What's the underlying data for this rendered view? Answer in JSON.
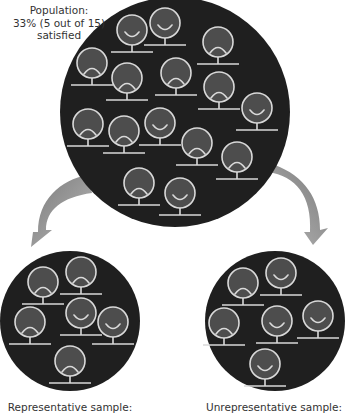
{
  "population": {
    "label_line1": "Population:",
    "label_line2": "33% (5 out of 15)",
    "label_line3": "satisfied",
    "total": 15,
    "satisfied": 5,
    "faces": [
      {
        "x": 132,
        "y": 30,
        "mood": "smile"
      },
      {
        "x": 165,
        "y": 23,
        "mood": "smile"
      },
      {
        "x": 218,
        "y": 42,
        "mood": "frown"
      },
      {
        "x": 92,
        "y": 63,
        "mood": "frown"
      },
      {
        "x": 127,
        "y": 78,
        "mood": "frown"
      },
      {
        "x": 176,
        "y": 73,
        "mood": "frown"
      },
      {
        "x": 219,
        "y": 87,
        "mood": "frown"
      },
      {
        "x": 257,
        "y": 108,
        "mood": "smile"
      },
      {
        "x": 88,
        "y": 124,
        "mood": "frown"
      },
      {
        "x": 124,
        "y": 131,
        "mood": "frown"
      },
      {
        "x": 160,
        "y": 123,
        "mood": "smile"
      },
      {
        "x": 197,
        "y": 143,
        "mood": "frown"
      },
      {
        "x": 237,
        "y": 157,
        "mood": "frown"
      },
      {
        "x": 139,
        "y": 183,
        "mood": "frown"
      },
      {
        "x": 180,
        "y": 193,
        "mood": "smile"
      }
    ]
  },
  "representative_sample": {
    "label": "Representative sample:",
    "faces": [
      {
        "x": 43,
        "y": 282,
        "mood": "frown"
      },
      {
        "x": 81,
        "y": 272,
        "mood": "frown"
      },
      {
        "x": 30,
        "y": 322,
        "mood": "frown"
      },
      {
        "x": 81,
        "y": 313,
        "mood": "smile"
      },
      {
        "x": 113,
        "y": 322,
        "mood": "smile"
      },
      {
        "x": 70,
        "y": 361,
        "mood": "frown"
      }
    ]
  },
  "unrepresentative_sample": {
    "label": "Unrepresentative sample:",
    "faces": [
      {
        "x": 243,
        "y": 283,
        "mood": "frown"
      },
      {
        "x": 281,
        "y": 273,
        "mood": "smile"
      },
      {
        "x": 224,
        "y": 323,
        "mood": "frown"
      },
      {
        "x": 277,
        "y": 321,
        "mood": "smile"
      },
      {
        "x": 318,
        "y": 316,
        "mood": "smile"
      },
      {
        "x": 265,
        "y": 364,
        "mood": "smile"
      }
    ]
  },
  "colors": {
    "circle_bg": "#1f1f1f",
    "face_fill": "#4d4d4d",
    "face_stroke": "#d9d9d9",
    "arrow": "#9a9a9a",
    "text": "#333333"
  }
}
